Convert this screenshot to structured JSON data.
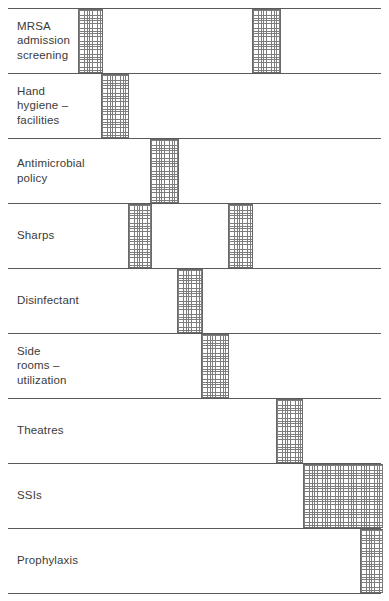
{
  "chart_data": {
    "type": "bar",
    "subtype": "gantt",
    "title": "",
    "xlabel": "",
    "ylabel": "",
    "grid": true,
    "legend": null,
    "orientation": "horizontal",
    "axis_range_px": [
      8,
      381
    ],
    "categories": [
      "MRSA\nadmission\nscreening",
      "Hand\nhygiene –\nfacilities",
      "Antimicrobial\npolicy",
      "Sharps",
      "Disinfectant",
      "Side\nrooms –\nutilization",
      "Theatres",
      "SSIs",
      "Prophylaxis"
    ],
    "rows": [
      {
        "label": "MRSA\nadmission\nscreening",
        "bars": [
          {
            "start": 78,
            "end": 103
          },
          {
            "start": 252,
            "end": 281
          }
        ]
      },
      {
        "label": "Hand\nhygiene –\nfacilities",
        "bars": [
          {
            "start": 101,
            "end": 129
          }
        ]
      },
      {
        "label": "Antimicrobial\npolicy",
        "bars": [
          {
            "start": 150,
            "end": 179
          }
        ]
      },
      {
        "label": "Sharps",
        "bars": [
          {
            "start": 128,
            "end": 152
          },
          {
            "start": 228,
            "end": 253
          }
        ]
      },
      {
        "label": "Disinfectant",
        "bars": [
          {
            "start": 177,
            "end": 203
          }
        ]
      },
      {
        "label": "Side\nrooms –\nutilization",
        "bars": [
          {
            "start": 201,
            "end": 229
          }
        ]
      },
      {
        "label": "Theatres",
        "bars": [
          {
            "start": 276,
            "end": 303
          }
        ]
      },
      {
        "label": "SSIs",
        "bars": [
          {
            "start": 303,
            "end": 383
          }
        ]
      },
      {
        "label": "Prophylaxis",
        "bars": [
          {
            "start": 360,
            "end": 383
          }
        ]
      }
    ],
    "row_boundaries_px": [
      8,
      73,
      138,
      203,
      268,
      333,
      398,
      463,
      528,
      593
    ],
    "colors": {
      "bar_hatch": "#7d7d7d",
      "bar_fill": "#ffffff",
      "bar_border": "#6a6a6a",
      "grid_line": "#5a5a5a",
      "label_text": "#3b3b3b",
      "background": "#ffffff"
    }
  }
}
